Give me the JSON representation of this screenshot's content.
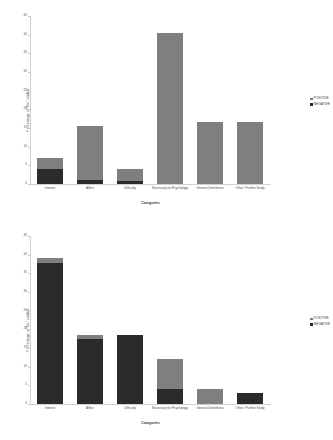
{
  "chart_data": [
    {
      "type": "bar",
      "stacked": true,
      "title": "",
      "xlabel": "Categories",
      "ylabel": "Percentage of \"No\" studets",
      "ylim": [
        0,
        45
      ],
      "yticks": [
        45,
        40,
        35,
        30,
        25,
        20,
        15,
        10,
        5,
        0
      ],
      "grid": false,
      "legend_position": "right",
      "categories": [
        "Interest",
        "Affect",
        "Difficulty",
        "Necessary for Psychology",
        "General Usefulness",
        "Other / Further Study"
      ],
      "series": [
        {
          "name": "POSITIVE",
          "color": "#7f7f7f",
          "values": [
            3.0,
            14.5,
            3.2,
            40.5,
            16.5,
            16.5
          ]
        },
        {
          "name": "NEGATIVE",
          "color": "#2b2b2b",
          "values": [
            4.0,
            1.0,
            0.8,
            0.0,
            0.0,
            0.0
          ]
        }
      ]
    },
    {
      "type": "bar",
      "stacked": true,
      "title": "",
      "xlabel": "Categories",
      "ylabel": "Percentage of \"No\" studets",
      "ylim": [
        0,
        45
      ],
      "yticks": [
        45,
        40,
        35,
        30,
        25,
        20,
        15,
        10,
        5,
        0
      ],
      "grid": false,
      "legend_position": "right",
      "categories": [
        "Interest",
        "Affect",
        "Difficulty",
        "Necessary for Psychology",
        "General Usefulness",
        "Other / Further Study"
      ],
      "series": [
        {
          "name": "POSITIVE",
          "color": "#7f7f7f",
          "values": [
            1.3,
            1.2,
            0.0,
            8.0,
            4.0,
            0.0
          ]
        },
        {
          "name": "NEGATIVE",
          "color": "#2b2b2b",
          "values": [
            37.7,
            17.3,
            18.5,
            4.0,
            0.0,
            3.0
          ]
        }
      ]
    }
  ]
}
